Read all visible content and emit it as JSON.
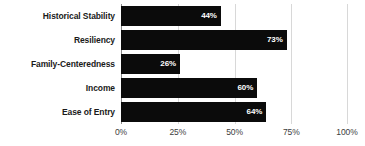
{
  "chart_data": {
    "type": "bar",
    "orientation": "horizontal",
    "title": "",
    "subtitle": "",
    "xlabel": "",
    "ylabel": "",
    "categories": [
      "Historical Stability",
      "Resiliency",
      "Family-Centeredness",
      "Income",
      "Ease of Entry"
    ],
    "values": [
      44,
      73,
      26,
      60,
      64
    ],
    "value_labels": [
      "44%",
      "73%",
      "26%",
      "60%",
      "64%"
    ],
    "xlim": [
      0,
      100
    ],
    "xticks": [
      0,
      25,
      50,
      75,
      100
    ],
    "xtick_labels": [
      "0%",
      "25%",
      "50%",
      "75%",
      "100%"
    ],
    "grid": true,
    "legend": false,
    "bar_color": "#0b0b0b",
    "value_label_color": "#ffffff",
    "category_label_color": "#1a1a1a",
    "tick_label_color": "#3d3d3d",
    "gridline_color": "#d8d8d8",
    "axis_line_color": "#8a8a8a",
    "background_color": "#ffffff"
  }
}
